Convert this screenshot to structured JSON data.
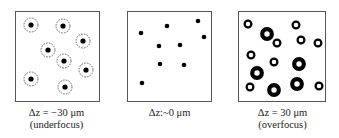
{
  "panels": [
    {
      "label": "Δz = −30 μm",
      "sublabel": "(underfocus)",
      "type": "underfocus",
      "spots": [
        [
          15,
          13
        ],
        [
          47,
          14
        ],
        [
          67,
          29
        ],
        [
          32,
          38
        ],
        [
          48,
          49
        ],
        [
          70,
          58
        ],
        [
          15,
          67
        ],
        [
          49,
          75
        ]
      ]
    },
    {
      "label": "Δz:~0 μm",
      "sublabel": "",
      "type": "focus",
      "spots": [
        [
          13,
          21
        ],
        [
          39,
          14
        ],
        [
          70,
          9
        ],
        [
          76,
          25
        ],
        [
          31,
          34
        ],
        [
          52,
          33
        ],
        [
          32,
          52
        ],
        [
          56,
          53
        ],
        [
          14,
          71
        ]
      ]
    },
    {
      "label": "Δz = 30 μm",
      "sublabel": "(overfocus)",
      "type": "overfocus",
      "spots": [
        [
          9,
          12,
          3
        ],
        [
          28,
          22,
          5
        ],
        [
          38,
          31,
          3
        ],
        [
          57,
          13,
          3
        ],
        [
          62,
          28,
          3
        ],
        [
          79,
          31,
          3
        ],
        [
          12,
          43,
          3
        ],
        [
          35,
          50,
          3
        ],
        [
          18,
          61,
          5
        ],
        [
          60,
          52,
          5
        ],
        [
          11,
          75,
          3
        ],
        [
          35,
          78,
          5
        ],
        [
          58,
          72,
          5
        ],
        [
          80,
          74,
          3
        ]
      ]
    }
  ]
}
